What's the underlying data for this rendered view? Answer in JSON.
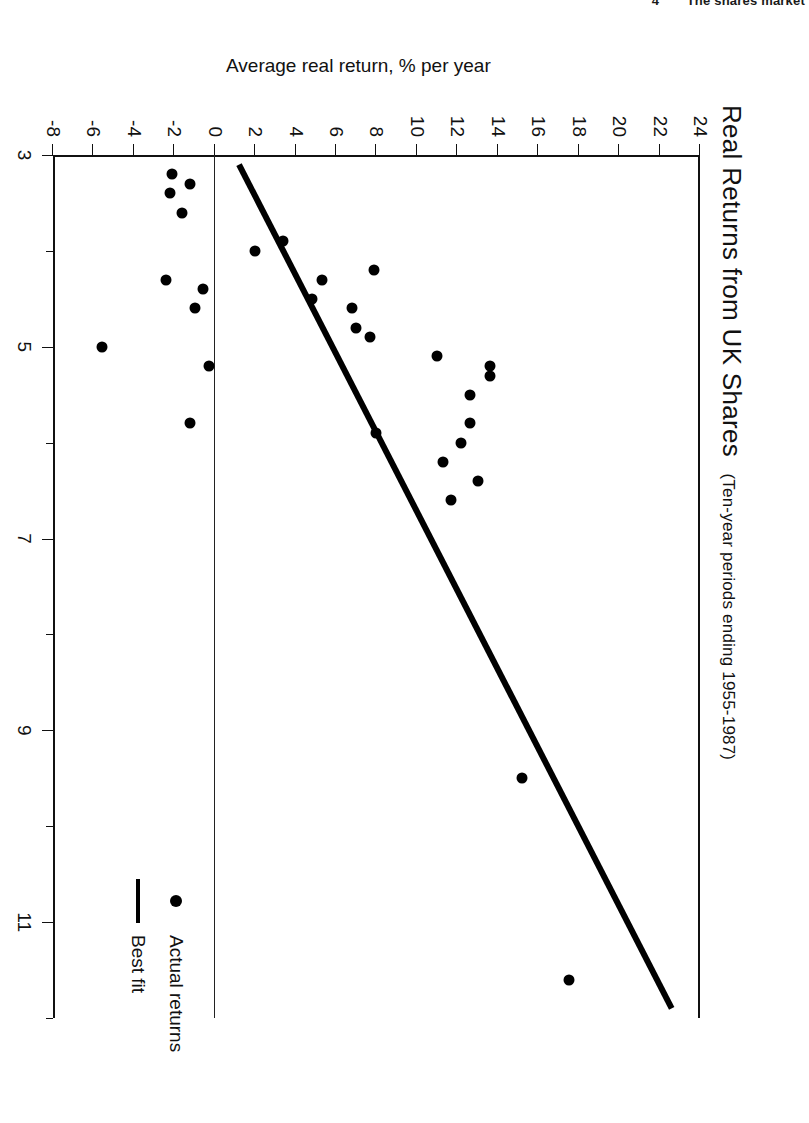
{
  "page_header": {
    "page_number": "4",
    "running_head": "The shares market"
  },
  "figure": {
    "title_main": "Real Returns from UK Shares",
    "title_sub": "(Ten-year periods ending 1955-1987)",
    "legend": [
      {
        "label": "Actual returns",
        "marker": "dot-marker"
      },
      {
        "label": "Best fit",
        "marker": "line-marker"
      }
    ]
  },
  "chart_data": {
    "type": "scatter",
    "title": "Real Returns from UK Shares (Ten-year periods ending 1955-1987)",
    "xlabel": "Dividend yield at start of decade, %",
    "ylabel": "Average real return, % per year",
    "xlim": [
      3,
      12
    ],
    "ylim": [
      -8,
      24
    ],
    "xticks_major": [
      3,
      5,
      7,
      9,
      11
    ],
    "xticks_minor": [
      4,
      6,
      8,
      10,
      12
    ],
    "xtick_labels": [
      "3",
      "5",
      "7",
      "9",
      "11"
    ],
    "yticks": [
      24,
      22,
      20,
      18,
      16,
      14,
      12,
      10,
      8,
      6,
      4,
      2,
      0,
      -2,
      -4,
      -6,
      -8
    ],
    "ytick_labels": [
      "24",
      "22",
      "20",
      "18",
      "16",
      "14",
      "12",
      "10",
      "8",
      "6",
      "4",
      "2",
      "0",
      "-2",
      "-4",
      "-6",
      "-8"
    ],
    "grid": false,
    "legend_position": "inside-right",
    "zero_reference_line": 0,
    "series": [
      {
        "name": "Actual returns",
        "type": "scatter",
        "marker": "filled-circle",
        "color": "#000000",
        "points": [
          [
            11.6,
            17.5
          ],
          [
            9.5,
            15.2
          ],
          [
            6.2,
            11.3
          ],
          [
            6.4,
            13.0
          ],
          [
            6.0,
            12.2
          ],
          [
            6.6,
            11.7
          ],
          [
            5.8,
            12.6
          ],
          [
            5.5,
            12.6
          ],
          [
            5.2,
            13.6
          ],
          [
            5.3,
            13.6
          ],
          [
            5.1,
            11.0
          ],
          [
            4.9,
            7.7
          ],
          [
            4.8,
            7.0
          ],
          [
            4.6,
            6.8
          ],
          [
            4.5,
            4.8
          ],
          [
            4.3,
            5.3
          ],
          [
            4.2,
            7.9
          ],
          [
            4.0,
            2.0
          ],
          [
            3.9,
            3.4
          ],
          [
            5.9,
            8.0
          ],
          [
            4.4,
            -0.6
          ],
          [
            5.2,
            -0.3
          ],
          [
            5.8,
            -1.2
          ],
          [
            4.6,
            -1.0
          ],
          [
            4.3,
            -2.4
          ],
          [
            3.6,
            -1.6
          ],
          [
            3.4,
            -2.2
          ],
          [
            3.3,
            -1.2
          ],
          [
            3.2,
            -2.1
          ],
          [
            5.0,
            -5.6
          ]
        ]
      },
      {
        "name": "Best fit",
        "type": "line",
        "color": "#000000",
        "endpoints": [
          [
            3.1,
            1.2
          ],
          [
            11.9,
            22.6
          ]
        ]
      }
    ]
  }
}
